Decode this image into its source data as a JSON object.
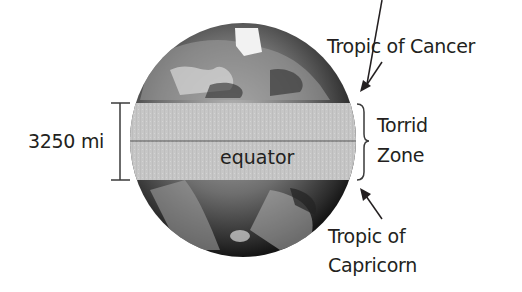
{
  "diagram": {
    "labels": {
      "tropic_cancer": "Tropic of Cancer",
      "torrid_line1": "Torrid",
      "torrid_line2": "Zone",
      "tropic_capricorn_line1": "Tropic of",
      "tropic_capricorn_line2": "Capricorn",
      "equator": "equator",
      "width_measure": "3250 mi"
    },
    "colors": {
      "band": "#c9c9c9",
      "globe_dark": "#2a2a2a",
      "globe_mid": "#7a7a7a",
      "text": "#231f20",
      "lines": "#3a3a3a"
    }
  }
}
